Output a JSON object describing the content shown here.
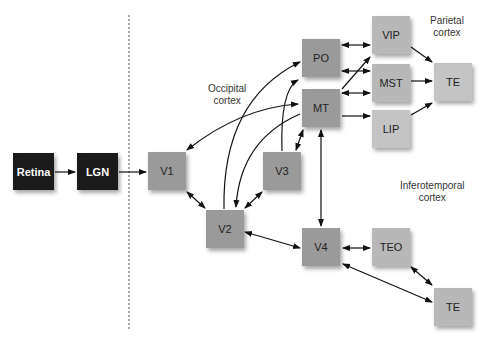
{
  "diagram": {
    "nodes": {
      "retina": "Retina",
      "lgn": "LGN",
      "v1": "V1",
      "v2": "V2",
      "v3": "V3",
      "po": "PO",
      "mt": "MT",
      "vip": "VIP",
      "mst": "MST",
      "lip": "LIP",
      "te_parietal": "TE",
      "v4": "V4",
      "teo": "TEO",
      "te_temporal": "TE"
    },
    "region_labels": {
      "occipital": "Occipital\ncortex",
      "parietal": "Parietal\ncortex",
      "inferotemporal": "Inferotemporal\ncortex"
    },
    "edges": [
      {
        "from": "Retina",
        "to": "LGN",
        "type": "one-way"
      },
      {
        "from": "LGN",
        "to": "V1",
        "type": "one-way"
      },
      {
        "from": "V1",
        "to": "V2",
        "type": "two-way"
      },
      {
        "from": "V1",
        "to": "MT",
        "type": "two-way"
      },
      {
        "from": "V2",
        "to": "V3",
        "type": "two-way"
      },
      {
        "from": "V2",
        "to": "PO",
        "type": "one-way"
      },
      {
        "from": "MT",
        "to": "V2",
        "type": "one-way"
      },
      {
        "from": "V3",
        "to": "PO",
        "type": "one-way"
      },
      {
        "from": "V3",
        "to": "MT",
        "type": "two-way"
      },
      {
        "from": "V2",
        "to": "V4",
        "type": "two-way"
      },
      {
        "from": "MT",
        "to": "V4",
        "type": "two-way"
      },
      {
        "from": "PO",
        "to": "VIP",
        "type": "two-way"
      },
      {
        "from": "PO",
        "to": "MST",
        "type": "two-way"
      },
      {
        "from": "MT",
        "to": "VIP",
        "type": "one-way"
      },
      {
        "from": "MT",
        "to": "MST",
        "type": "two-way"
      },
      {
        "from": "MT",
        "to": "LIP",
        "type": "one-way"
      },
      {
        "from": "VIP",
        "to": "TE",
        "type": "one-way"
      },
      {
        "from": "MST",
        "to": "TE",
        "type": "one-way"
      },
      {
        "from": "LIP",
        "to": "TE",
        "type": "one-way"
      },
      {
        "from": "V4",
        "to": "TEO",
        "type": "two-way"
      },
      {
        "from": "TEO",
        "to": "TE",
        "type": "two-way"
      },
      {
        "from": "V4",
        "to": "TE",
        "type": "two-way"
      }
    ],
    "colors": {
      "subcortical": "#1a1a1a",
      "cortical": "#9a9a9a",
      "parietal": "#b8b8b8"
    }
  }
}
